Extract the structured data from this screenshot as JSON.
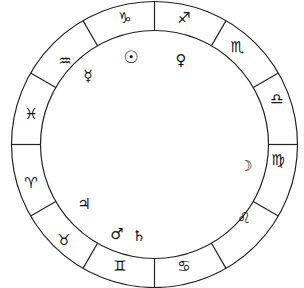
{
  "wheel": {
    "center": [
      154.5,
      144.5
    ],
    "outer_radius": 143,
    "inner_radius": 114,
    "stroke": "#222222",
    "background": "#ffffff"
  },
  "signs": [
    {
      "name": "Capricorn",
      "symbol": "♑︎",
      "x": 125,
      "y": 18
    },
    {
      "name": "Sagittarius",
      "symbol": "♐︎",
      "x": 184,
      "y": 18
    },
    {
      "name": "Scorpio",
      "symbol": "♏︎",
      "x": 237,
      "y": 47
    },
    {
      "name": "Libra",
      "symbol": "♎︎",
      "x": 277,
      "y": 99
    },
    {
      "name": "Virgo",
      "symbol": "♍︎",
      "x": 278,
      "y": 160
    },
    {
      "name": "Leo",
      "symbol": "♌︎",
      "x": 244,
      "y": 218
    },
    {
      "name": "Cancer",
      "symbol": "♋︎",
      "x": 184,
      "y": 266
    },
    {
      "name": "Gemini",
      "symbol": "♊︎",
      "x": 120,
      "y": 266
    },
    {
      "name": "Taurus",
      "symbol": "♉︎",
      "x": 64,
      "y": 240
    },
    {
      "name": "Aries",
      "symbol": "♈︎",
      "x": 31,
      "y": 183
    },
    {
      "name": "Pisces",
      "symbol": "♓︎",
      "x": 31,
      "y": 114
    },
    {
      "name": "Aquarius",
      "symbol": "♒︎",
      "x": 65,
      "y": 61
    }
  ],
  "planets": [
    {
      "name": "Sun",
      "symbol": "☉",
      "x": 131,
      "y": 57,
      "cls": "sun"
    },
    {
      "name": "Venus",
      "symbol": "♀",
      "x": 181,
      "y": 60,
      "cls": ""
    },
    {
      "name": "Mercury",
      "symbol": "☿",
      "x": 88,
      "y": 76,
      "cls": ""
    },
    {
      "name": "Moon",
      "symbol": "☽",
      "x": 246,
      "y": 166,
      "cls": ""
    },
    {
      "name": "Jupiter",
      "symbol": "♃",
      "x": 84,
      "y": 204,
      "cls": ""
    },
    {
      "name": "Mars",
      "symbol": "♂",
      "x": 117,
      "y": 234,
      "cls": ""
    },
    {
      "name": "Saturn",
      "symbol": "♄",
      "x": 139,
      "y": 236,
      "cls": ""
    }
  ]
}
